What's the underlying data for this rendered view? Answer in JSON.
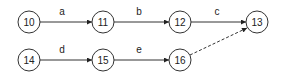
{
  "diagram": {
    "type": "activity-on-arrow network",
    "nodes": [
      {
        "id": "10",
        "label": "10",
        "x": 29,
        "y": 22
      },
      {
        "id": "11",
        "label": "11",
        "x": 103,
        "y": 22
      },
      {
        "id": "12",
        "label": "12",
        "x": 180,
        "y": 22
      },
      {
        "id": "13",
        "label": "13",
        "x": 257,
        "y": 22
      },
      {
        "id": "14",
        "label": "14",
        "x": 29,
        "y": 60
      },
      {
        "id": "15",
        "label": "15",
        "x": 103,
        "y": 60
      },
      {
        "id": "16",
        "label": "16",
        "x": 180,
        "y": 60
      }
    ],
    "edges": [
      {
        "from": "10",
        "to": "11",
        "label": "a",
        "style": "solid"
      },
      {
        "from": "11",
        "to": "12",
        "label": "b",
        "style": "solid"
      },
      {
        "from": "12",
        "to": "13",
        "label": "c",
        "style": "solid"
      },
      {
        "from": "14",
        "to": "15",
        "label": "d",
        "style": "solid"
      },
      {
        "from": "15",
        "to": "16",
        "label": "e",
        "style": "solid"
      },
      {
        "from": "16",
        "to": "13",
        "label": "",
        "style": "dashed"
      }
    ]
  }
}
